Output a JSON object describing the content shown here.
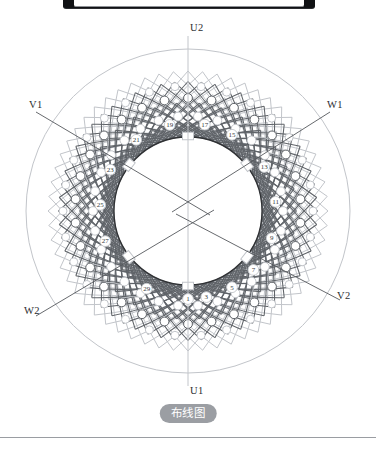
{
  "caption": {
    "text": "布线图"
  },
  "diagram": {
    "title": "布线图",
    "type": "stator-winding-layout",
    "slot_count": 30,
    "center": {
      "x": 188,
      "y": 211
    },
    "radii": {
      "outer_envelope": 162,
      "outer_core": 148,
      "winding_outer": 140,
      "winding_inner": 78,
      "bore": 74,
      "coil_ring_outer": 113,
      "coil_ring_inner": 95
    },
    "colors": {
      "arc_dark": "#5f6368",
      "arc_light": "#c2c5ca",
      "bore_line": "#2f3134",
      "outline": "#8b8e93",
      "label_text": "#2b2d30",
      "caption_bg": "#9b9ea3",
      "caption_text": "#ffffff",
      "bracket": "#111215",
      "rule": "#9a9da2"
    },
    "slot_labels": [
      {
        "number": "1",
        "angle_deg": 90
      },
      {
        "number": "3",
        "angle_deg": 78
      },
      {
        "number": "5",
        "angle_deg": 60
      },
      {
        "number": "7",
        "angle_deg": 42
      },
      {
        "number": "9",
        "angle_deg": 18
      },
      {
        "number": "11",
        "angle_deg": 354
      },
      {
        "number": "13",
        "angle_deg": 330
      },
      {
        "number": "15",
        "angle_deg": 300
      },
      {
        "number": "17",
        "angle_deg": 281
      },
      {
        "number": "19",
        "angle_deg": 258
      },
      {
        "number": "21",
        "angle_deg": 234
      },
      {
        "number": "23",
        "angle_deg": 208
      },
      {
        "number": "25",
        "angle_deg": 184
      },
      {
        "number": "27",
        "angle_deg": 160
      },
      {
        "number": "29",
        "angle_deg": 118
      }
    ],
    "terminals": [
      {
        "name": "U2",
        "label": "U2",
        "position": "top",
        "x": 188,
        "y": 36,
        "label_x": 190,
        "label_y": 28
      },
      {
        "name": "U1",
        "label": "U1",
        "position": "bottom",
        "x": 188,
        "y": 386,
        "label_x": 190,
        "label_y": 386
      },
      {
        "name": "V1",
        "label": "V1",
        "position": "upper-left",
        "x": 34,
        "y": 115,
        "label_x": 29,
        "label_y": 105
      },
      {
        "name": "W1",
        "label": "W1",
        "position": "upper-right",
        "x": 330,
        "y": 115,
        "label_x": 326,
        "label_y": 105
      },
      {
        "name": "W2",
        "label": "W2",
        "position": "lower-left",
        "x": 34,
        "y": 312,
        "label_x": 24,
        "label_y": 309
      },
      {
        "name": "V2",
        "label": "V2",
        "position": "lower-right",
        "x": 340,
        "y": 298,
        "label_x": 336,
        "label_y": 294
      }
    ],
    "bore_tabs": [
      {
        "angle_deg": 270,
        "kind": "radial"
      },
      {
        "angle_deg": 90,
        "kind": "radial"
      },
      {
        "angle_deg": 218,
        "kind": "angled"
      },
      {
        "angle_deg": 322,
        "kind": "angled"
      },
      {
        "angle_deg": 142,
        "kind": "angled"
      },
      {
        "angle_deg": 38,
        "kind": "angled"
      }
    ]
  }
}
